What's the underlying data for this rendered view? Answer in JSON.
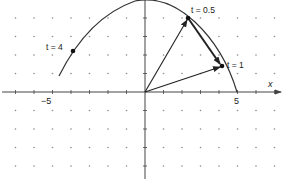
{
  "diagram": {
    "type": "parametric-curve-with-vectors",
    "axes": {
      "x_label": "x",
      "tick_labels": [
        {
          "value": -5,
          "text": "−5"
        },
        {
          "value": 5,
          "text": "5"
        }
      ]
    },
    "grid": {
      "style": "dots",
      "spacing": 1
    },
    "points": [
      {
        "id": "t4",
        "label": "t = 4",
        "x": -3.9,
        "y": 2.2
      },
      {
        "id": "t05",
        "label": "t = 0.5",
        "x": 2.3,
        "y": 4.0
      },
      {
        "id": "t1",
        "label": "t = 1",
        "x": 4.2,
        "y": 1.4
      }
    ],
    "vectors": [
      {
        "from": "origin",
        "to": "t05",
        "description": "position vector r(0.5)"
      },
      {
        "from": "origin",
        "to": "t1",
        "description": "position vector r(1)"
      },
      {
        "from": "t05",
        "to": "t1",
        "description": "difference vector r(1) − r(0.5)"
      }
    ],
    "colors": {
      "curve": "#333333",
      "vectors": "#222222",
      "dots": "#888888",
      "axes": "#444444"
    }
  }
}
